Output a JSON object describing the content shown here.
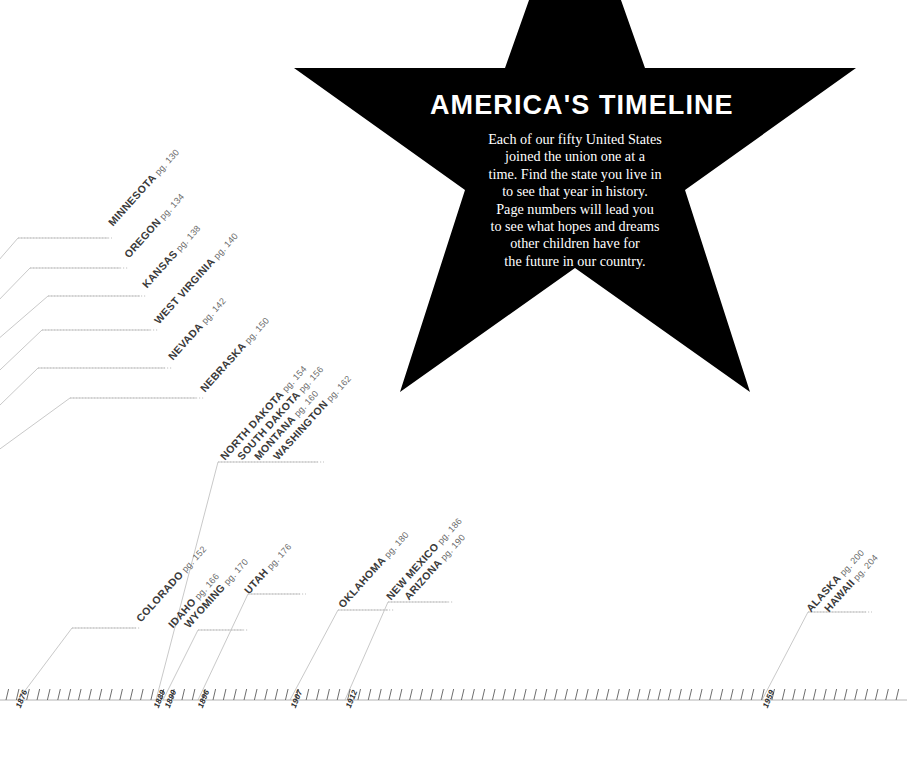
{
  "poster": {
    "title": "AMERICA'S TIMELINE",
    "body_lines": [
      "Each of our fifty United States",
      "joined the union one at a",
      "time. Find the state you live in",
      "to see that year in history.",
      "Page numbers will lead you",
      "to see what hopes and dreams",
      "other children have for",
      "the future in our country."
    ],
    "star_color": "#000000",
    "text_color": "#ffffff",
    "background_color": "#ffffff",
    "label_color": "#3a3a3a",
    "pg_color": "#6a6a6a",
    "line_color": "#c9c9c9"
  },
  "chart_data": {
    "type": "timeline",
    "title": "AMERICA'S TIMELINE",
    "xlabel": "",
    "ylabel": "",
    "axis_orientation": "horizontal",
    "grid": false,
    "legend": "none",
    "tick_interval_years": 1,
    "labeled_years": [
      "1876",
      "1889",
      "1890",
      "1896",
      "1907",
      "1912",
      "1959"
    ],
    "entries": [
      {
        "state": "MINNESOTA",
        "pg": "pg. 130",
        "year": "1858"
      },
      {
        "state": "OREGON",
        "pg": "pg. 134",
        "year": "1859"
      },
      {
        "state": "KANSAS",
        "pg": "pg. 138",
        "year": "1861"
      },
      {
        "state": "WEST VIRGINIA",
        "pg": "pg. 140",
        "year": "1863"
      },
      {
        "state": "NEVADA",
        "pg": "pg. 142",
        "year": "1864"
      },
      {
        "state": "NEBRASKA",
        "pg": "pg. 150",
        "year": "1867"
      },
      {
        "state": "COLORADO",
        "pg": "pg. 152",
        "year": "1876"
      },
      {
        "state": "NORTH DAKOTA",
        "pg": "pg. 154",
        "year": "1889"
      },
      {
        "state": "SOUTH DAKOTA",
        "pg": "pg. 156",
        "year": "1889"
      },
      {
        "state": "MONTANA",
        "pg": "pg. 160",
        "year": "1889"
      },
      {
        "state": "WASHINGTON",
        "pg": "pg. 162",
        "year": "1889"
      },
      {
        "state": "IDAHO",
        "pg": "pg. 166",
        "year": "1890"
      },
      {
        "state": "WYOMING",
        "pg": "pg. 170",
        "year": "1890"
      },
      {
        "state": "UTAH",
        "pg": "pg. 176",
        "year": "1896"
      },
      {
        "state": "OKLAHOMA",
        "pg": "pg. 180",
        "year": "1907"
      },
      {
        "state": "NEW MEXICO",
        "pg": "pg. 186",
        "year": "1912"
      },
      {
        "state": "ARIZONA",
        "pg": "pg. 190",
        "year": "1912"
      },
      {
        "state": "ALASKA",
        "pg": "pg. 200",
        "year": "1959"
      },
      {
        "state": "HAWAII",
        "pg": "pg. 204",
        "year": "1959"
      }
    ]
  },
  "labels": {
    "minnesota": {
      "name": "MINNESOTA",
      "pg": "pg. 130"
    },
    "oregon": {
      "name": "OREGON",
      "pg": "pg. 134"
    },
    "kansas": {
      "name": "KANSAS",
      "pg": "pg. 138"
    },
    "west_virginia": {
      "name": "WEST VIRGINIA",
      "pg": "pg. 140"
    },
    "nevada": {
      "name": "NEVADA",
      "pg": "pg. 142"
    },
    "nebraska": {
      "name": "NEBRASKA",
      "pg": "pg. 150"
    },
    "colorado": {
      "name": "COLORADO",
      "pg": "pg. 152"
    },
    "north_dakota": {
      "name": "NORTH DAKOTA",
      "pg": "pg. 154"
    },
    "south_dakota": {
      "name": "SOUTH DAKOTA",
      "pg": "pg. 156"
    },
    "montana": {
      "name": "MONTANA",
      "pg": "pg. 160"
    },
    "washington": {
      "name": "WASHINGTON",
      "pg": "pg. 162"
    },
    "idaho": {
      "name": "IDAHO",
      "pg": "pg. 166"
    },
    "wyoming": {
      "name": "WYOMING",
      "pg": "pg. 170"
    },
    "utah": {
      "name": "UTAH",
      "pg": "pg. 176"
    },
    "oklahoma": {
      "name": "OKLAHOMA",
      "pg": "pg. 180"
    },
    "new_mexico": {
      "name": "NEW MEXICO",
      "pg": "pg. 186"
    },
    "arizona": {
      "name": "ARIZONA",
      "pg": "pg. 190"
    },
    "alaska": {
      "name": "ALASKA",
      "pg": "pg. 200"
    },
    "hawaii": {
      "name": "HAWAII",
      "pg": "pg. 204"
    }
  },
  "years": {
    "y1876": "1876",
    "y1889": "1889",
    "y1890": "1890",
    "y1896": "1896",
    "y1907": "1907",
    "y1912": "1912",
    "y1959": "1959"
  }
}
